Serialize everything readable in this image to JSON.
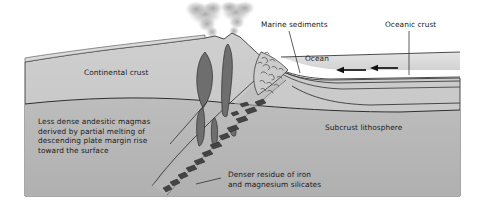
{
  "figure": {
    "type": "geological-cross-section-diagram",
    "background_color": "#ffffff",
    "block_fill_top": "#c9c9c9",
    "block_fill_lower": "#b5b5b5",
    "ocean_fill": "#dcdcdc",
    "magma_fill": "#6d6d6d",
    "slab_fragment_fill": "#4a4a4a",
    "plume_fill": "#b9b9b9",
    "line_color": "#2a2a2a",
    "text_color": "#1b1b1b"
  },
  "labels": {
    "continental_crust": "Continental crust",
    "marine_sediments": "Marine sediments",
    "oceanic_crust": "Oceanic crust",
    "ocean": "Ocean",
    "subcrust_lithosphere": "Subcrust lithosphere",
    "magma_note": "Less dense andesitic magmas\nderived by partial melting of\ndescending plate margin rise\ntoward the surface",
    "residue_note": "Denser residue of iron\nand magnesium silicates"
  },
  "annotations": [
    {
      "name": "marine-sediments",
      "text": "Marine sediments",
      "leader": true
    },
    {
      "name": "oceanic-crust",
      "text": "Oceanic crust",
      "leader": true
    },
    {
      "name": "ocean",
      "text": "Ocean",
      "leader": false
    },
    {
      "name": "continental-crust",
      "text": "Continental crust",
      "leader": false
    },
    {
      "name": "subcrust-lithosphere",
      "text": "Subcrust lithosphere",
      "leader": false
    },
    {
      "name": "andesitic-magma-note",
      "text": "Less dense andesitic magmas derived by partial melting of descending plate margin rise toward the surface",
      "leader": true
    },
    {
      "name": "denser-residue-note",
      "text": "Denser residue of iron and magnesium silicates",
      "leader": true
    }
  ],
  "plate_motion": {
    "direction": "left",
    "arrow_count": 2,
    "description": "Oceanic plate converging toward trench"
  },
  "features": {
    "volcano_count": 2,
    "smoke_plume_count": 2,
    "magma_body_count": 5,
    "slab_fragment_count": 14
  }
}
